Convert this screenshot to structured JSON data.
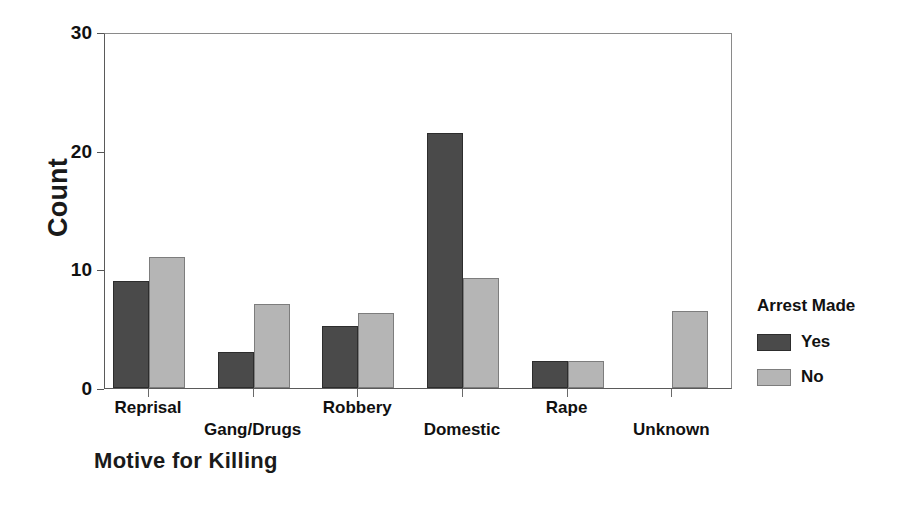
{
  "chart_data": {
    "type": "bar",
    "title": "",
    "xlabel": "Motive for Killing",
    "ylabel": "Count",
    "categories": [
      "Reprisal",
      "Gang/Drugs",
      "Robbery",
      "Domestic",
      "Rape",
      "Unknown"
    ],
    "series": [
      {
        "name": "Yes",
        "values": [
          9,
          3,
          5.2,
          21.5,
          2.3,
          0
        ],
        "color": "#4a4a4a"
      },
      {
        "name": "No",
        "values": [
          11,
          7.1,
          6.3,
          9.3,
          2.3,
          6.5
        ],
        "color": "#b5b5b5"
      }
    ],
    "ylim": [
      0,
      30
    ],
    "yticks": [
      0,
      10,
      20,
      30
    ],
    "ytick_labels": [
      "0",
      "10",
      "20",
      "30"
    ],
    "grid": false,
    "legend": {
      "title": "Arrest Made",
      "position": "right",
      "entries": [
        "Yes",
        "No"
      ]
    }
  },
  "axes": {
    "y_title": "Count",
    "x_title": "Motive for Killing",
    "y_ticks": [
      "30",
      "20",
      "10",
      "0"
    ]
  },
  "legend": {
    "title": "Arrest Made",
    "items": [
      {
        "label": "Yes",
        "swatch": "dark-gray-swatch"
      },
      {
        "label": "No",
        "swatch": "light-gray-swatch"
      }
    ]
  },
  "x_labels": [
    {
      "text": "Reprisal",
      "row": 0
    },
    {
      "text": "Gang/Drugs",
      "row": 1
    },
    {
      "text": "Robbery",
      "row": 0
    },
    {
      "text": "Domestic",
      "row": 1
    },
    {
      "text": "Rape",
      "row": 0
    },
    {
      "text": "Unknown",
      "row": 1
    }
  ]
}
